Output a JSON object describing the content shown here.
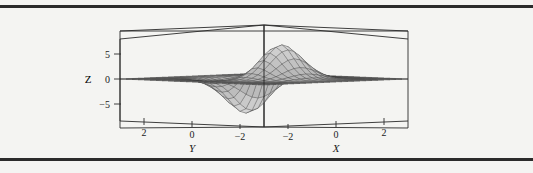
{
  "figure": {
    "name": "surface-plot-figure",
    "background_color": "#f4f4f2",
    "rule_color": "#2b2b2b",
    "has_top_rule": true,
    "has_bottom_rule": true
  },
  "chart_data": {
    "type": "line",
    "render": "3d-surface-mesh",
    "title": "",
    "subtitle": "",
    "xlabel": "X",
    "ylabel": "Y",
    "zlabel": "Z",
    "xlim": [
      -3,
      3
    ],
    "ylim": [
      -3,
      3
    ],
    "zlim": [
      -8,
      8
    ],
    "x_ticks": [
      -2,
      0,
      2
    ],
    "x_tick_labels": [
      "−2",
      "0",
      "2"
    ],
    "y_ticks": [
      2,
      0,
      -2
    ],
    "y_tick_labels": [
      "2",
      "0",
      "−2"
    ],
    "z_ticks": [
      5,
      0,
      -5
    ],
    "z_tick_labels": [
      "5",
      "0",
      "−5"
    ],
    "grid": false,
    "legend": null,
    "view": "near-edge-on, azimuth centered, low elevation",
    "box_frame": true,
    "mesh_fill_color": "#d9d9d9",
    "mesh_line_color": "#3a3a3a",
    "frame_color": "#2a2a2a",
    "peak_value": 7,
    "trough_value": -7,
    "surface_grid_u": 24,
    "surface_grid_v": 24
  },
  "labels": {
    "z_axis": "Z",
    "x_axis": "X",
    "y_axis": "Y",
    "z_5": "5",
    "z_0": "0",
    "z_neg5": "−5",
    "y_2": "2",
    "y_0": "0",
    "y_neg2": "−2",
    "x_neg2": "−2",
    "x_0": "0",
    "x_2": "2"
  }
}
